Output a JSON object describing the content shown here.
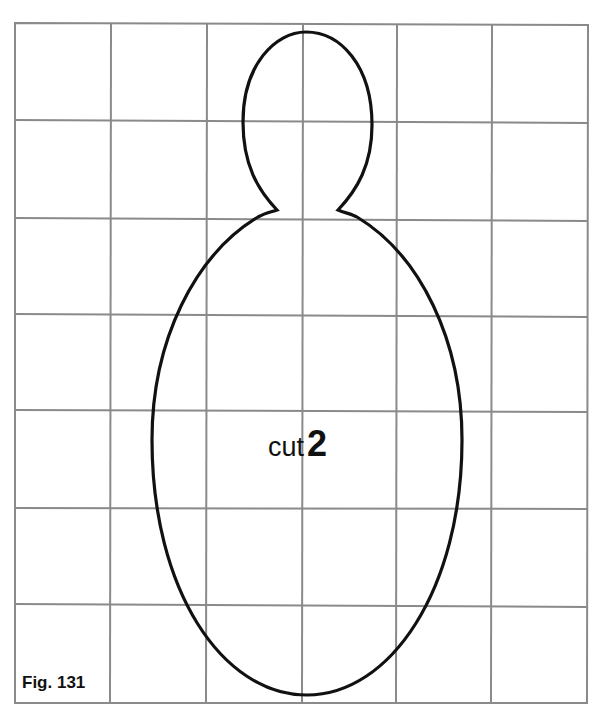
{
  "figure": {
    "caption": "Fig. 131",
    "label_word": "cut",
    "label_count": "2",
    "grid": {
      "columns": 6,
      "rows": 7,
      "line_color": "#8a8a8a"
    },
    "pattern_shape": "doll-pattern-outline",
    "outline_color": "#111111"
  }
}
